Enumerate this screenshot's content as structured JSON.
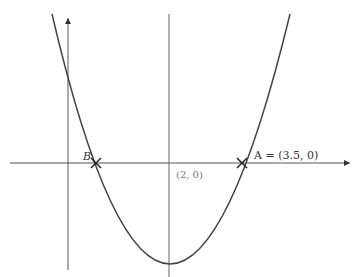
{
  "diagram": {
    "type": "parabola-graph",
    "curve": "y = (x - 2)^2 - k (upward parabola)",
    "axis_of_symmetry_label": "(2, 0)",
    "points": [
      {
        "name": "A",
        "label": "A = (3.5, 0)"
      },
      {
        "name": "B",
        "label": "B"
      }
    ],
    "colors": {
      "curve": "#444444",
      "axes": "#555555",
      "symmetry": "#666666",
      "marker": "#222222"
    }
  }
}
